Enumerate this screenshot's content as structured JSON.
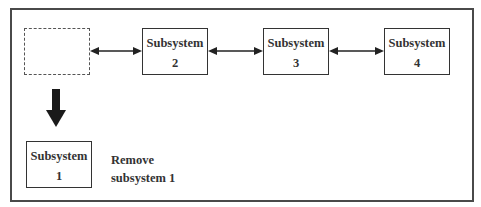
{
  "diagram": {
    "removed_slot": {
      "label": ""
    },
    "subsystems": [
      {
        "id": "subsystem-2",
        "line1": "Subsystem",
        "line2": "2"
      },
      {
        "id": "subsystem-3",
        "line1": "Subsystem",
        "line2": "3"
      },
      {
        "id": "subsystem-4",
        "line1": "Subsystem",
        "line2": "4"
      }
    ],
    "removed": {
      "line1": "Subsystem",
      "line2": "1"
    },
    "caption": {
      "line1": "Remove",
      "line2": "subsystem 1"
    },
    "connections": [
      {
        "from": "removed-slot",
        "to": "subsystem-2",
        "type": "bidirectional"
      },
      {
        "from": "subsystem-2",
        "to": "subsystem-3",
        "type": "bidirectional"
      },
      {
        "from": "subsystem-3",
        "to": "subsystem-4",
        "type": "bidirectional"
      },
      {
        "from": "removed-slot",
        "to": "subsystem-1",
        "type": "thick-down-arrow"
      }
    ],
    "colors": {
      "stroke": "#333333",
      "frame": "#4a4a4a",
      "background": "#ffffff"
    }
  }
}
